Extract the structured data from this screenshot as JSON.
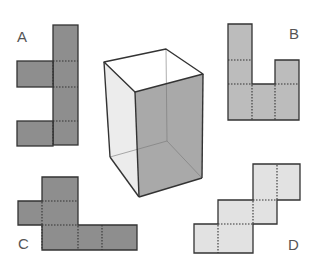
{
  "diagram": {
    "labels": {
      "a": "A",
      "b": "B",
      "c": "C",
      "d": "D"
    },
    "colors": {
      "net_a": "#8e8e8e",
      "net_b": "#bcbcbc",
      "net_c": "#8e8e8e",
      "net_d": "#e2e2e2",
      "box_left_face": "#ececec",
      "box_front_face": "#a9a9a9",
      "box_top_face": "#ffffff",
      "stroke": "#333333"
    },
    "options": [
      {
        "id": "A",
        "faces": 6
      },
      {
        "id": "B",
        "faces": 6
      },
      {
        "id": "C",
        "faces": 6
      },
      {
        "id": "D",
        "faces": 6
      }
    ]
  }
}
